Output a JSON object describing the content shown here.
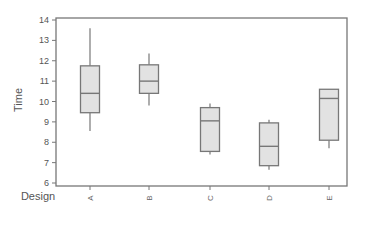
{
  "chart_data": {
    "type": "boxplot",
    "title": "",
    "xlabel": "Design",
    "ylabel": "Time",
    "ylim": [
      6,
      14
    ],
    "yticks": [
      6,
      7,
      8,
      9,
      10,
      11,
      12,
      13,
      14
    ],
    "categories": [
      "A",
      "B",
      "C",
      "D",
      "E"
    ],
    "boxes": [
      {
        "category": "A",
        "whisker_low": 8.55,
        "q1": 9.45,
        "median": 10.4,
        "q3": 11.75,
        "whisker_high": 13.6
      },
      {
        "category": "B",
        "whisker_low": 9.8,
        "q1": 10.4,
        "median": 11.0,
        "q3": 11.8,
        "whisker_high": 12.35
      },
      {
        "category": "C",
        "whisker_low": 7.4,
        "q1": 7.55,
        "median": 9.05,
        "q3": 9.7,
        "whisker_high": 9.9
      },
      {
        "category": "D",
        "whisker_low": 6.65,
        "q1": 6.85,
        "median": 7.8,
        "q3": 8.95,
        "whisker_high": 9.1
      },
      {
        "category": "E",
        "whisker_low": 7.7,
        "q1": 8.1,
        "median": 10.15,
        "q3": 10.6,
        "whisker_high": 10.6
      }
    ],
    "grid": false,
    "legend": null,
    "colors": {
      "box_fill": "#e2e2e2",
      "box_stroke": "#777777",
      "frame": "#777777",
      "text": "#555555"
    }
  }
}
